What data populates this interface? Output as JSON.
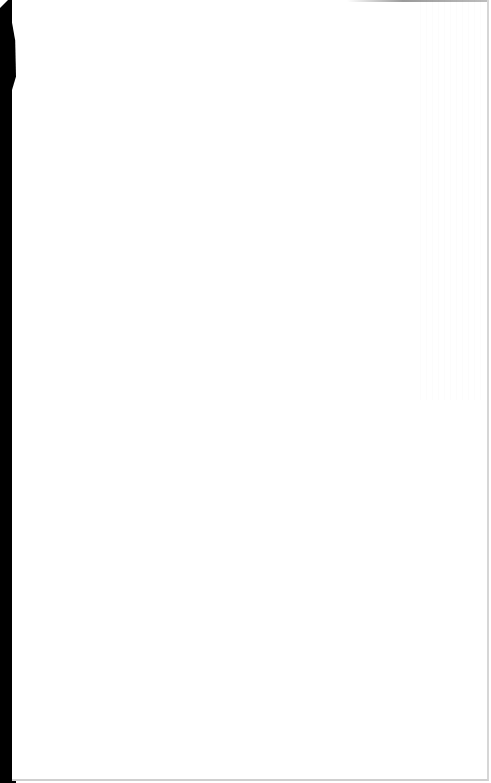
{
  "document": {
    "kind": "blank paper sheet",
    "text_content": "",
    "colors": {
      "paper": "#ffffff",
      "background_edge": "#000000",
      "border": "#d6d6d6"
    }
  }
}
